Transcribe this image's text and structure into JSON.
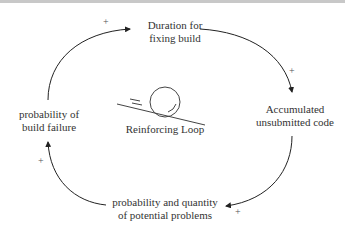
{
  "nodes": {
    "duration": {
      "line1": "Duration for",
      "line2": "fixing build"
    },
    "accumulated": {
      "line1": "Accumulated",
      "line2": "unsubmitted code"
    },
    "problems": {
      "line1": "probability and quantity",
      "line2": "of potential problems"
    },
    "failure": {
      "line1": "probability of",
      "line2": "build failure"
    }
  },
  "loop": {
    "label": "Reinforcing Loop"
  },
  "polarities": {
    "failure_to_duration": "+",
    "duration_to_accumulated": "+",
    "accumulated_to_problems": "+",
    "problems_to_failure": "+"
  },
  "colors": {
    "line": "#222222",
    "text": "#333333"
  }
}
